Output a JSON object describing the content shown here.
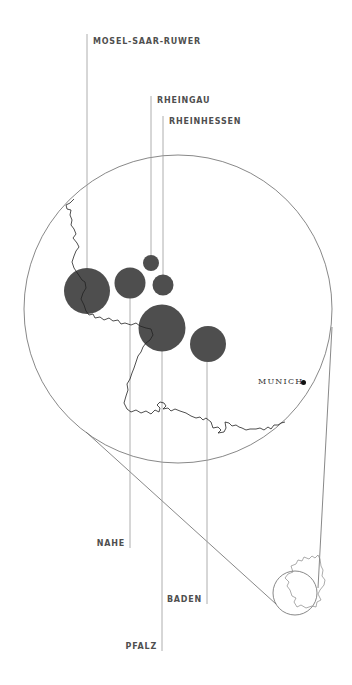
{
  "diagram": {
    "type": "bubble-map-callout",
    "region": "Germany wine regions",
    "colors": {
      "bubble": "#4e4e4e",
      "leader_line": "#9a9a9a",
      "outline": "#666666",
      "border": "#222222",
      "label": "#4f4f4f"
    },
    "regions": [
      {
        "name": "MOSEL-SAAR-RUWER",
        "cx": 87,
        "cy": 291,
        "r": 23,
        "label_side": "top"
      },
      {
        "name": "RHEINGAU",
        "cx": 151,
        "cy": 263,
        "r": 8,
        "label_side": "top"
      },
      {
        "name": "RHEINHESSEN",
        "cx": 163,
        "cy": 285,
        "r": 10.5,
        "label_side": "top"
      },
      {
        "name": "NAHE",
        "cx": 130,
        "cy": 283,
        "r": 15.5,
        "label_side": "bottom"
      },
      {
        "name": "BADEN",
        "cx": 208,
        "cy": 344,
        "r": 18,
        "label_side": "bottom"
      },
      {
        "name": "PFALZ",
        "cx": 162,
        "cy": 328,
        "r": 23.5,
        "label_side": "bottom"
      }
    ],
    "city": {
      "name": "MUNICH",
      "x": 303,
      "y": 382
    },
    "magnifier": {
      "cx": 178,
      "cy": 309,
      "r": 154
    },
    "inset": {
      "cx": 295,
      "cy": 593,
      "r": 22
    }
  },
  "labels": {
    "mosel": "MOSEL-SAAR-RUWER",
    "rheingau": "RHEINGAU",
    "rheinhessen": "RHEINHESSEN",
    "nahe": "NAHE",
    "baden": "BADEN",
    "pfalz": "PFALZ",
    "munich": "MUNICH"
  }
}
